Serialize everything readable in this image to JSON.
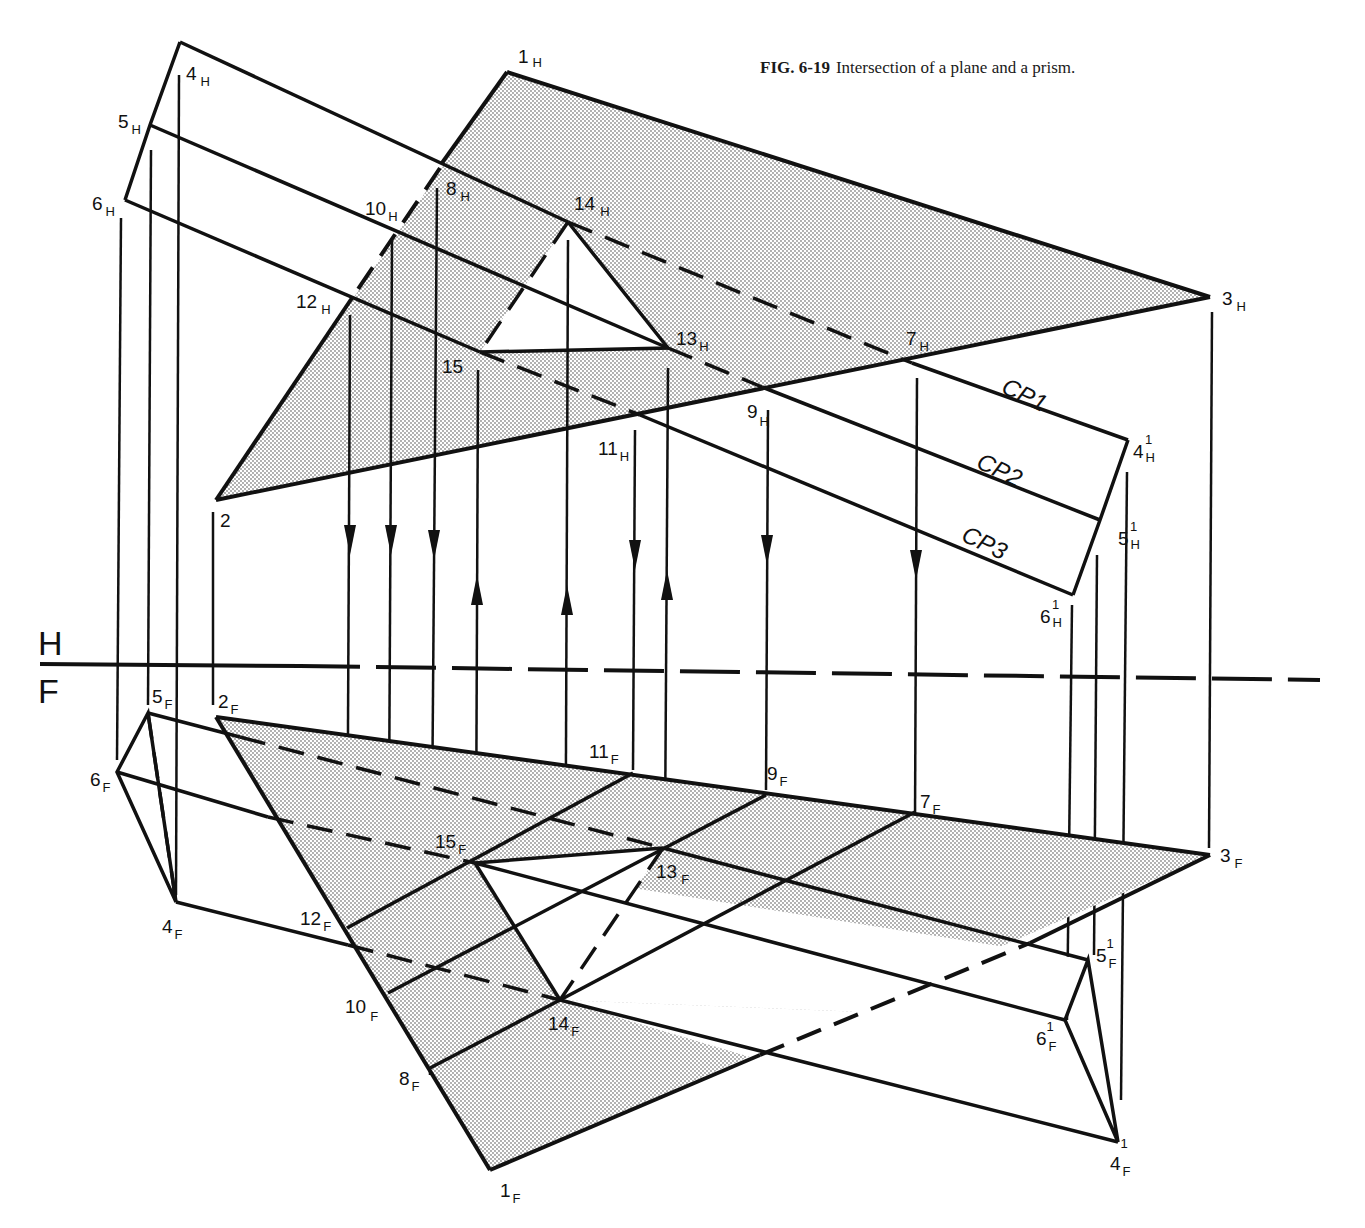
{
  "caption": {
    "figure_number": "FIG. 6-19",
    "text": "Intersection of a plane and a prism."
  },
  "colors": {
    "ink": "#111111",
    "shade_dot": "#9a9a9a",
    "background": "#ffffff"
  },
  "reference_line": {
    "top_label": "H",
    "bottom_label": "F",
    "y": 667,
    "x_start": 40,
    "x_end": 1320
  },
  "cutting_planes": [
    {
      "label": "CP1",
      "x": 1000,
      "y": 392,
      "angle": 26
    },
    {
      "label": "CP2",
      "x": 975,
      "y": 467,
      "angle": 26
    },
    {
      "label": "CP3",
      "x": 960,
      "y": 540,
      "angle": 26
    }
  ],
  "top_view": {
    "plane": {
      "1": [
        507,
        72
      ],
      "2": [
        216,
        500
      ],
      "3": [
        1210,
        297
      ]
    },
    "prism_ends": {
      "4H": [
        180,
        42
      ],
      "5H": [
        150,
        125
      ],
      "6H": [
        125,
        200
      ],
      "4H1": [
        1128,
        440
      ],
      "5H1": [
        1100,
        520
      ],
      "6H1": [
        1073,
        595
      ]
    },
    "section": {
      "13H": [
        668,
        348
      ],
      "14H": [
        568,
        222
      ],
      "15": [
        480,
        352
      ]
    },
    "labels": [
      {
        "id": "1H",
        "main": "1",
        "sub": "H",
        "x": 518,
        "y": 63
      },
      {
        "id": "2",
        "main": "2",
        "sub": "",
        "x": 220,
        "y": 527
      },
      {
        "id": "3H",
        "main": "3",
        "sub": "H",
        "x": 1222,
        "y": 305
      },
      {
        "id": "4H",
        "main": "4",
        "sub": "H",
        "x": 186,
        "y": 80
      },
      {
        "id": "5H",
        "main": "5",
        "sub": "H",
        "x": 118,
        "y": 128
      },
      {
        "id": "6H",
        "main": "6",
        "sub": "H",
        "x": 92,
        "y": 210
      },
      {
        "id": "7H",
        "main": "7",
        "sub": "H",
        "x": 906,
        "y": 345
      },
      {
        "id": "8H",
        "main": "8",
        "sub": "H",
        "x": 446,
        "y": 195
      },
      {
        "id": "9H",
        "main": "9",
        "sub": "H",
        "x": 747,
        "y": 418
      },
      {
        "id": "10H",
        "main": "10",
        "sub": "H",
        "x": 365,
        "y": 215
      },
      {
        "id": "11H",
        "main": "11",
        "sub": "H",
        "x": 598,
        "y": 455
      },
      {
        "id": "12H",
        "main": "12",
        "sub": "H",
        "x": 296,
        "y": 308
      },
      {
        "id": "13H",
        "main": "13",
        "sub": "H",
        "x": 676,
        "y": 345
      },
      {
        "id": "14H",
        "main": "14",
        "sub": "H",
        "x": 574,
        "y": 210
      },
      {
        "id": "15",
        "main": "15",
        "sub": "",
        "x": 442,
        "y": 373
      },
      {
        "id": "4H1",
        "main": "4",
        "sub": "H",
        "sup": "1",
        "x": 1133,
        "y": 458
      },
      {
        "id": "5H1",
        "main": "5",
        "sub": "H",
        "sup": "1",
        "x": 1118,
        "y": 545
      },
      {
        "id": "6H1",
        "main": "6",
        "sub": "H",
        "sup": "1",
        "x": 1040,
        "y": 623
      }
    ]
  },
  "front_view": {
    "plane": {
      "1": [
        490,
        1170
      ],
      "2": [
        216,
        717
      ],
      "3": [
        1210,
        855
      ]
    },
    "prism_ends": {
      "4F": [
        176,
        902
      ],
      "5F": [
        148,
        713
      ],
      "6F": [
        117,
        772
      ],
      "4F1": [
        1118,
        1142
      ],
      "5F1": [
        1088,
        960
      ],
      "6F1": [
        1065,
        1020
      ]
    },
    "section": {
      "13F": [
        663,
        848
      ],
      "14F": [
        560,
        1000
      ],
      "15F": [
        475,
        863
      ]
    },
    "labels": [
      {
        "id": "1F",
        "main": "1",
        "sub": "F",
        "x": 500,
        "y": 1197
      },
      {
        "id": "2F",
        "main": "2",
        "sub": "F",
        "x": 218,
        "y": 708
      },
      {
        "id": "3F",
        "main": "3",
        "sub": "F",
        "x": 1220,
        "y": 862
      },
      {
        "id": "4F",
        "main": "4",
        "sub": "F",
        "x": 162,
        "y": 933
      },
      {
        "id": "5F",
        "main": "5",
        "sub": "F",
        "x": 152,
        "y": 703
      },
      {
        "id": "6F",
        "main": "6",
        "sub": "F",
        "x": 90,
        "y": 786
      },
      {
        "id": "7F",
        "main": "7",
        "sub": "F",
        "x": 920,
        "y": 808
      },
      {
        "id": "8F",
        "main": "8",
        "sub": "F",
        "x": 399,
        "y": 1085
      },
      {
        "id": "9F",
        "main": "9",
        "sub": "F",
        "x": 767,
        "y": 780
      },
      {
        "id": "10F",
        "main": "10",
        "sub": "F",
        "x": 345,
        "y": 1013
      },
      {
        "id": "11F",
        "main": "11",
        "sub": "F",
        "x": 589,
        "y": 758
      },
      {
        "id": "12F",
        "main": "12",
        "sub": "F",
        "x": 300,
        "y": 925
      },
      {
        "id": "13F",
        "main": "13",
        "sub": "F",
        "x": 656,
        "y": 878
      },
      {
        "id": "14F",
        "main": "14",
        "sub": "F",
        "x": 548,
        "y": 1030
      },
      {
        "id": "15F",
        "main": "15",
        "sub": "F",
        "x": 435,
        "y": 848
      },
      {
        "id": "4F1",
        "main": "4",
        "sub": "F",
        "sup": "1",
        "x": 1110,
        "y": 1170
      },
      {
        "id": "5F1",
        "main": "5",
        "sub": "F",
        "sup": "1",
        "x": 1096,
        "y": 962
      },
      {
        "id": "6F1",
        "main": "6",
        "sub": "F",
        "sup": "1",
        "x": 1036,
        "y": 1045
      }
    ]
  }
}
